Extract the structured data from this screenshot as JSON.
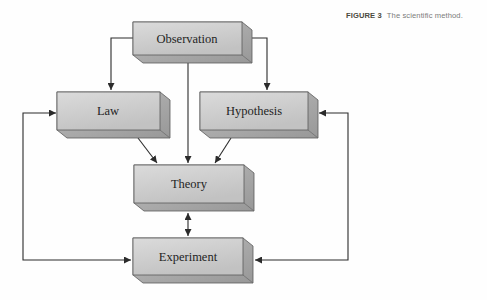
{
  "figure": {
    "label": "FIGURE 3",
    "caption": "The scientific method."
  },
  "diagram": {
    "nodes": [
      {
        "id": "observation",
        "label": "Observation"
      },
      {
        "id": "law",
        "label": "Law"
      },
      {
        "id": "hypothesis",
        "label": "Hypothesis"
      },
      {
        "id": "theory",
        "label": "Theory"
      },
      {
        "id": "experiment",
        "label": "Experiment"
      }
    ],
    "edges": [
      {
        "from": "observation",
        "to": "law",
        "direction": "one-way"
      },
      {
        "from": "observation",
        "to": "hypothesis",
        "direction": "one-way"
      },
      {
        "from": "observation",
        "to": "theory",
        "direction": "one-way"
      },
      {
        "from": "law",
        "to": "theory",
        "direction": "one-way"
      },
      {
        "from": "hypothesis",
        "to": "theory",
        "direction": "one-way"
      },
      {
        "from": "theory",
        "to": "experiment",
        "direction": "two-way"
      },
      {
        "from": "experiment",
        "to": "law",
        "direction": "two-way"
      },
      {
        "from": "experiment",
        "to": "hypothesis",
        "direction": "two-way"
      }
    ]
  },
  "colors": {
    "background": "#fefefe",
    "box_face_top": "#d9d9d9",
    "box_face_bottom": "#c3c3c3",
    "box_side_light": "#b8b8b8",
    "box_side_dark": "#9b9b9b",
    "box_border": "#5a5a5a",
    "arrow": "#2b2b2b",
    "figure_label_text": "#4b4a40",
    "caption_text": "#7b7b7b",
    "node_text": "#1f1f1f"
  }
}
